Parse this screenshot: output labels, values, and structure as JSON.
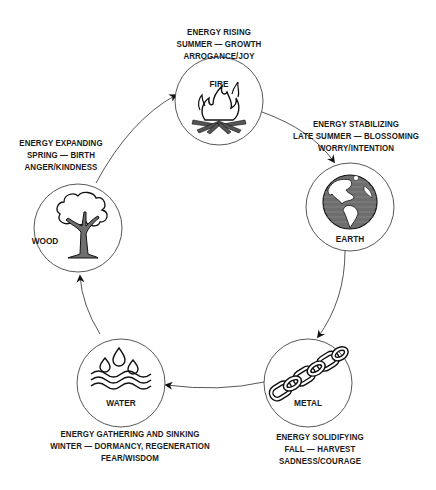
{
  "diagram": {
    "type": "cycle",
    "elements": [
      {
        "name": "FIRE",
        "icon": "campfire-icon",
        "lines": [
          "ENERGY RISING",
          "SUMMER — GROWTH",
          "ARROGANCE/JOY"
        ]
      },
      {
        "name": "EARTH",
        "icon": "globe-icon",
        "lines": [
          "ENERGY STABILIZING",
          "LATE SUMMER — BLOSSOMING",
          "WORRY/INTENTION"
        ]
      },
      {
        "name": "METAL",
        "icon": "chain-icon",
        "lines": [
          "ENERGY SOLIDIFYING",
          "FALL — HARVEST",
          "SADNESS/COURAGE"
        ]
      },
      {
        "name": "WATER",
        "icon": "water-drops-waves-icon",
        "lines": [
          "ENERGY GATHERING AND SINKING",
          "WINTER — DORMANCY, REGENERATION",
          "FEAR/WISDOM"
        ]
      },
      {
        "name": "WOOD",
        "icon": "tree-icon",
        "lines": [
          "ENERGY EXPANDING",
          "SPRING — BIRTH",
          "ANGER/KINDNESS"
        ]
      }
    ],
    "flow": [
      "FIRE → EARTH",
      "EARTH → METAL",
      "METAL → WATER",
      "WATER → WOOD",
      "WOOD → FIRE"
    ],
    "colors": {
      "line": "#333333",
      "text": "#1a1a1a",
      "fill_gray": "#7a7a7a",
      "background": "#ffffff"
    }
  }
}
